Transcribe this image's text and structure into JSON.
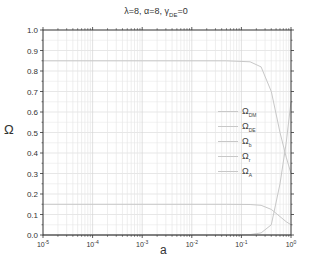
{
  "chart_data": {
    "type": "line",
    "title_parts": {
      "main": "λ=8, α=8, γ",
      "sub": "DE",
      "tail": "=0"
    },
    "xlabel": "a",
    "ylabel": "Ω",
    "xscale": "log",
    "xlim": [
      1e-05,
      1
    ],
    "ylim": [
      0.0,
      1.0
    ],
    "x_ticks": [
      "10^-5",
      "10^-4",
      "10^-3",
      "10^-2",
      "10^-1",
      "10^0"
    ],
    "x_tick_labels": [
      {
        "base": "10",
        "exp": "-5"
      },
      {
        "base": "10",
        "exp": "-4"
      },
      {
        "base": "10",
        "exp": "-3"
      },
      {
        "base": "10",
        "exp": "-2"
      },
      {
        "base": "10",
        "exp": "-1"
      },
      {
        "base": "10",
        "exp": "0"
      }
    ],
    "y_ticks": [
      "0.0",
      "0.1",
      "0.2",
      "0.3",
      "0.4",
      "0.5",
      "0.6",
      "0.7",
      "0.8",
      "0.9",
      "1.0"
    ],
    "grid": true,
    "legend_position": "right-center",
    "series": [
      {
        "name": "Ω_DM",
        "label_main": "Ω",
        "label_sub": "DM",
        "color": "#c8c8c8",
        "x": [
          1e-05,
          0.001,
          0.05,
          0.15,
          0.25,
          0.4,
          0.6,
          0.8,
          1.0
        ],
        "values": [
          0.85,
          0.85,
          0.85,
          0.845,
          0.82,
          0.7,
          0.5,
          0.38,
          0.3
        ]
      },
      {
        "name": "Ω_DE",
        "label_main": "Ω",
        "label_sub": "DE",
        "color": "#c8c8c8",
        "x": [
          1e-05,
          0.05,
          0.15,
          0.25,
          0.4,
          0.6,
          0.8,
          1.0
        ],
        "values": [
          0.0,
          0.0,
          0.002,
          0.01,
          0.05,
          0.25,
          0.45,
          0.65
        ]
      },
      {
        "name": "Ω_b",
        "label_main": "Ω",
        "label_sub": "b",
        "color": "#c8c8c8",
        "x": [
          1e-05,
          0.001,
          0.05,
          0.15,
          0.25,
          0.4,
          0.6,
          0.8,
          1.0
        ],
        "values": [
          0.15,
          0.15,
          0.15,
          0.149,
          0.145,
          0.125,
          0.09,
          0.065,
          0.05
        ]
      },
      {
        "name": "Ω_r",
        "label_main": "Ω",
        "label_sub": "r",
        "color": "#c8c8c8",
        "x": [
          1e-05,
          1.0
        ],
        "values": [
          0.0,
          0.0
        ]
      },
      {
        "name": "Ω_A",
        "label_main": "Ω",
        "label_sub": "A",
        "color": "#c8c8c8",
        "x": [
          1e-05,
          1.0
        ],
        "values": [
          0.0,
          0.0
        ]
      }
    ]
  }
}
